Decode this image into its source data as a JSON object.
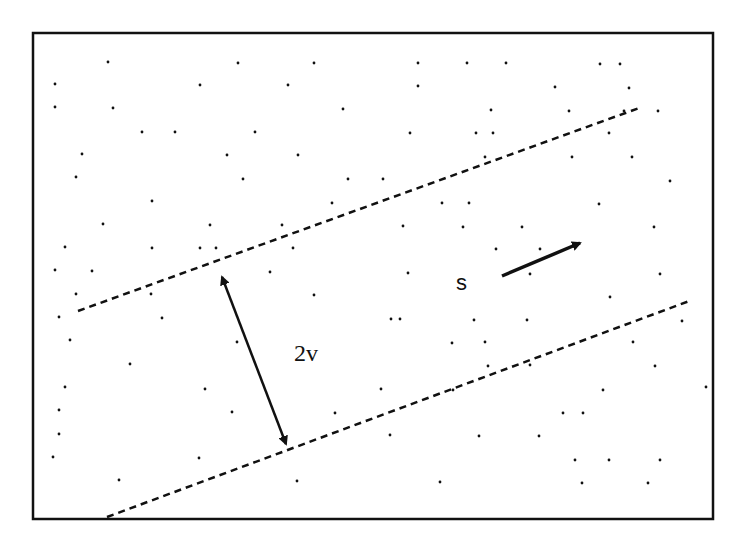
{
  "diagram": {
    "frame": {
      "x": 33,
      "y": 33,
      "w": 680,
      "h": 486
    },
    "labels": {
      "s": "s",
      "width": "2v"
    },
    "colors": {
      "ink": "#111111",
      "background": "#ffffff"
    },
    "upper_boundary": {
      "x1": 78,
      "y1": 311,
      "x2": 642,
      "y2": 107
    },
    "lower_boundary": {
      "x1": 107,
      "y1": 517,
      "x2": 692,
      "y2": 300
    },
    "width_arrow": {
      "x1": 222,
      "y1": 277,
      "x2": 286,
      "y2": 444
    },
    "s_arrow": {
      "x1": 502,
      "y1": 276,
      "x2": 580,
      "y2": 243
    },
    "points": [
      [
        108,
        62
      ],
      [
        238,
        63
      ],
      [
        314,
        63
      ],
      [
        418,
        63
      ],
      [
        467,
        63
      ],
      [
        506,
        63
      ],
      [
        600,
        64
      ],
      [
        620,
        64
      ],
      [
        55,
        84
      ],
      [
        200,
        85
      ],
      [
        288,
        85
      ],
      [
        418,
        86
      ],
      [
        555,
        87
      ],
      [
        629,
        88
      ],
      [
        55,
        107
      ],
      [
        113,
        108
      ],
      [
        343,
        109
      ],
      [
        491,
        110
      ],
      [
        569,
        111
      ],
      [
        624,
        111
      ],
      [
        658,
        111
      ],
      [
        142,
        132
      ],
      [
        175,
        132
      ],
      [
        255,
        132
      ],
      [
        410,
        133
      ],
      [
        476,
        133
      ],
      [
        493,
        133
      ],
      [
        609,
        133
      ],
      [
        82,
        154
      ],
      [
        227,
        155
      ],
      [
        298,
        155
      ],
      [
        485,
        157
      ],
      [
        572,
        157
      ],
      [
        632,
        157
      ],
      [
        76,
        177
      ],
      [
        243,
        179
      ],
      [
        348,
        179
      ],
      [
        383,
        179
      ],
      [
        670,
        181
      ],
      [
        152,
        201
      ],
      [
        332,
        203
      ],
      [
        442,
        203
      ],
      [
        469,
        203
      ],
      [
        599,
        204
      ],
      [
        103,
        224
      ],
      [
        210,
        225
      ],
      [
        282,
        225
      ],
      [
        403,
        226
      ],
      [
        463,
        227
      ],
      [
        522,
        227
      ],
      [
        654,
        227
      ],
      [
        65,
        247
      ],
      [
        152,
        248
      ],
      [
        200,
        248
      ],
      [
        216,
        248
      ],
      [
        293,
        248
      ],
      [
        496,
        249
      ],
      [
        540,
        249
      ],
      [
        55,
        270
      ],
      [
        92,
        271
      ],
      [
        270,
        272
      ],
      [
        408,
        273
      ],
      [
        530,
        274
      ],
      [
        660,
        274
      ],
      [
        76,
        294
      ],
      [
        151,
        294
      ],
      [
        314,
        295
      ],
      [
        610,
        297
      ],
      [
        59,
        317
      ],
      [
        162,
        318
      ],
      [
        391,
        319
      ],
      [
        400,
        319
      ],
      [
        474,
        320
      ],
      [
        527,
        320
      ],
      [
        682,
        321
      ],
      [
        70,
        340
      ],
      [
        237,
        342
      ],
      [
        452,
        343
      ],
      [
        485,
        342
      ],
      [
        633,
        342
      ],
      [
        130,
        364
      ],
      [
        488,
        366
      ],
      [
        530,
        365
      ],
      [
        655,
        366
      ],
      [
        65,
        387
      ],
      [
        205,
        389
      ],
      [
        381,
        389
      ],
      [
        453,
        390
      ],
      [
        603,
        390
      ],
      [
        706,
        387
      ],
      [
        59,
        410
      ],
      [
        232,
        412
      ],
      [
        335,
        413
      ],
      [
        563,
        413
      ],
      [
        583,
        413
      ],
      [
        59,
        434
      ],
      [
        390,
        435
      ],
      [
        479,
        436
      ],
      [
        539,
        436
      ],
      [
        609,
        460
      ],
      [
        660,
        460
      ],
      [
        53,
        457
      ],
      [
        199,
        458
      ],
      [
        575,
        460
      ],
      [
        119,
        480
      ],
      [
        297,
        481
      ],
      [
        440,
        482
      ],
      [
        582,
        483
      ],
      [
        648,
        483
      ]
    ]
  }
}
